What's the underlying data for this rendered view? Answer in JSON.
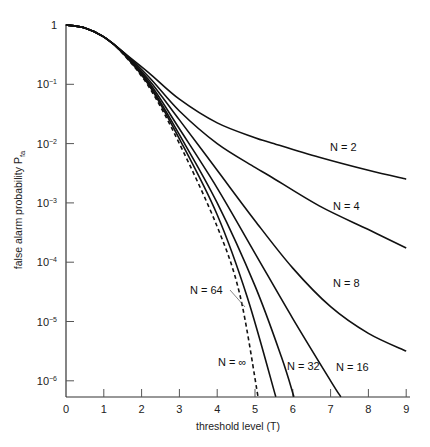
{
  "chart_data": {
    "type": "line",
    "title": "",
    "xlabel": "threshold level (T)",
    "ylabel": "false alarm probability P",
    "ylabel_subscript": "fa",
    "xscale": "linear",
    "yscale": "log",
    "xlim": [
      0,
      9
    ],
    "ylim": [
      5.4e-07,
      1
    ],
    "grid": false,
    "x_ticks": [
      "0",
      "1",
      "2",
      "3",
      "4",
      "5",
      "6",
      "7",
      "8",
      "9"
    ],
    "y_ticks": [
      {
        "base": "1",
        "exp": ""
      },
      {
        "base": "10",
        "exp": "-1"
      },
      {
        "base": "10",
        "exp": "-2"
      },
      {
        "base": "10",
        "exp": "-3"
      },
      {
        "base": "10",
        "exp": "-4"
      },
      {
        "base": "10",
        "exp": "-5"
      },
      {
        "base": "10",
        "exp": "-6"
      }
    ],
    "series": [
      {
        "name": "N = 2",
        "style": "solid",
        "points_T_log10P": [
          [
            0,
            0
          ],
          [
            0.5,
            -0.05
          ],
          [
            1,
            -0.2
          ],
          [
            1.5,
            -0.45
          ],
          [
            2.2,
            -0.81
          ],
          [
            3,
            -1.25
          ],
          [
            4,
            -1.65
          ],
          [
            5,
            -1.9
          ],
          [
            5.4,
            -1.98
          ],
          [
            6.7,
            -2.23
          ],
          [
            8,
            -2.45
          ],
          [
            9,
            -2.6
          ]
        ]
      },
      {
        "name": "N = 4",
        "style": "solid",
        "points_T_log10P": [
          [
            0,
            0
          ],
          [
            0.5,
            -0.05
          ],
          [
            1,
            -0.2
          ],
          [
            1.5,
            -0.45
          ],
          [
            2.2,
            -0.88
          ],
          [
            3,
            -1.45
          ],
          [
            4,
            -2.0
          ],
          [
            5,
            -2.4
          ],
          [
            5.4,
            -2.55
          ],
          [
            6.7,
            -3.05
          ],
          [
            8,
            -3.45
          ],
          [
            9,
            -3.76
          ]
        ]
      },
      {
        "name": "N = 8",
        "style": "solid",
        "points_T_log10P": [
          [
            0,
            0
          ],
          [
            0.5,
            -0.05
          ],
          [
            1,
            -0.2
          ],
          [
            1.5,
            -0.46
          ],
          [
            2.2,
            -0.93
          ],
          [
            3,
            -1.6
          ],
          [
            4,
            -2.45
          ],
          [
            5,
            -3.3
          ],
          [
            6,
            -4.1
          ],
          [
            7,
            -4.75
          ],
          [
            8,
            -5.2
          ],
          [
            9,
            -5.5
          ]
        ]
      },
      {
        "name": "N = 16",
        "style": "solid",
        "points_T_log10P": [
          [
            0,
            0
          ],
          [
            0.5,
            -0.05
          ],
          [
            1,
            -0.2
          ],
          [
            1.5,
            -0.46
          ],
          [
            2.2,
            -0.97
          ],
          [
            3,
            -1.75
          ],
          [
            4,
            -2.75
          ],
          [
            5,
            -3.85
          ],
          [
            6,
            -4.95
          ],
          [
            7,
            -6.0
          ],
          [
            7.27,
            -6.27
          ]
        ]
      },
      {
        "name": "N = 32",
        "style": "solid",
        "points_T_log10P": [
          [
            0,
            0
          ],
          [
            0.5,
            -0.05
          ],
          [
            1,
            -0.2
          ],
          [
            1.5,
            -0.47
          ],
          [
            2.2,
            -1.0
          ],
          [
            3,
            -1.85
          ],
          [
            4,
            -3.0
          ],
          [
            5,
            -4.4
          ],
          [
            5.7,
            -5.6
          ],
          [
            6.03,
            -6.27
          ]
        ]
      },
      {
        "name": "N = 64",
        "style": "solid",
        "points_T_log10P": [
          [
            0,
            0
          ],
          [
            0.5,
            -0.05
          ],
          [
            1,
            -0.2
          ],
          [
            1.5,
            -0.47
          ],
          [
            2.2,
            -1.02
          ],
          [
            3,
            -1.92
          ],
          [
            4,
            -3.2
          ],
          [
            4.8,
            -4.6
          ],
          [
            5.55,
            -6.27
          ]
        ]
      },
      {
        "name": "N = ∞",
        "style": "dashed",
        "points_T_log10P": [
          [
            0,
            0
          ],
          [
            0.5,
            -0.05
          ],
          [
            1,
            -0.2
          ],
          [
            1.5,
            -0.48
          ],
          [
            2.2,
            -1.05
          ],
          [
            3,
            -2.0
          ],
          [
            4,
            -3.4
          ],
          [
            4.6,
            -4.55
          ],
          [
            5.08,
            -6.27
          ]
        ]
      }
    ],
    "annotations": [
      {
        "text": "N = 2",
        "x": 330,
        "y": 151
      },
      {
        "text": "N = 4",
        "x": 333,
        "y": 210
      },
      {
        "text": "N = 8",
        "x": 333,
        "y": 287
      },
      {
        "text": "N = 16",
        "x": 336,
        "y": 371
      },
      {
        "text": "N = 32",
        "x": 287,
        "y": 370
      },
      {
        "text": "N = 64",
        "x": 190,
        "y": 294,
        "leader_to": [
          245,
          307
        ]
      },
      {
        "text": "N = ∞",
        "x": 218,
        "y": 366
      }
    ]
  }
}
